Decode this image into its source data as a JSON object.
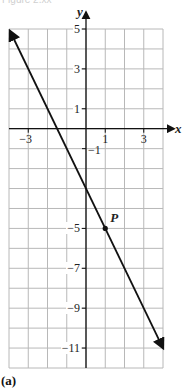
{
  "figure": {
    "caption": "Figure 2.xx",
    "panel_label": "(a)"
  },
  "axes": {
    "x_name": "x",
    "y_name": "y",
    "x_ticks": [
      {
        "value": -3,
        "label": "−3"
      },
      {
        "value": 1,
        "label": "1"
      },
      {
        "value": 3,
        "label": "3"
      }
    ],
    "y_ticks": [
      {
        "value": 5,
        "label": "5"
      },
      {
        "value": 3,
        "label": "3"
      },
      {
        "value": 1,
        "label": "1"
      },
      {
        "value": -1,
        "label": "−1"
      },
      {
        "value": -5,
        "label": "−5"
      },
      {
        "value": -7,
        "label": "−7"
      },
      {
        "value": -9,
        "label": "−9"
      },
      {
        "value": -11,
        "label": "−11"
      }
    ]
  },
  "point": {
    "label": "P",
    "x": 1,
    "y": -5
  },
  "colors": {
    "grid": "#b8b8b8",
    "axis": "#111111",
    "line": "#111111"
  },
  "chart_data": {
    "type": "line",
    "title": "",
    "xlabel": "x",
    "ylabel": "y",
    "xlim": [
      -4,
      4
    ],
    "ylim": [
      -12,
      5
    ],
    "grid": true,
    "series": [
      {
        "name": "line y = -2x - 3",
        "x": [
          -4,
          4
        ],
        "values": [
          5,
          -11
        ],
        "arrows": "both"
      }
    ],
    "annotations": [
      {
        "label": "P",
        "x": 1,
        "y": -5
      }
    ],
    "x_tick_labels": [
      "−3",
      "1",
      "3"
    ],
    "y_tick_labels": [
      "5",
      "3",
      "1",
      "−1",
      "−5",
      "−7",
      "−9",
      "−11"
    ]
  }
}
